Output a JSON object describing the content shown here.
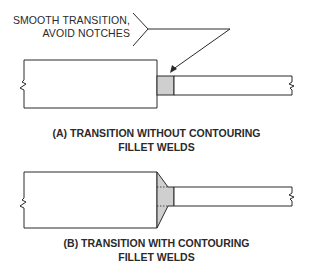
{
  "callout": {
    "line1": "SMOOTH TRANSITION,",
    "line2": "AVOID NOTCHES"
  },
  "figure_a": {
    "caption_line1": "(A) TRANSITION WITHOUT CONTOURING",
    "caption_line2": "FILLET WELDS"
  },
  "figure_b": {
    "caption_line1": "(B) TRANSITION WITH CONTOURING",
    "caption_line2": "FILLET WELDS"
  },
  "colors": {
    "line": "#2a2a2a",
    "weld_fill": "#cfcfcf",
    "background": "#ffffff"
  }
}
